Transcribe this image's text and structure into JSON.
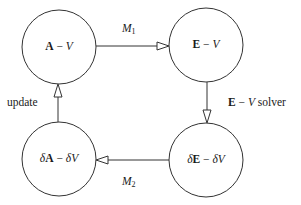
{
  "diagram": {
    "type": "flow-cycle",
    "nodes": [
      {
        "id": "av",
        "delta": "",
        "bold": "A",
        "sep": " − ",
        "deltaV": "",
        "ital": "V",
        "cx": 59,
        "cy": 47,
        "r": 37
      },
      {
        "id": "ev",
        "delta": "",
        "bold": "E",
        "sep": " − ",
        "deltaV": "",
        "ital": "V",
        "cx": 206,
        "cy": 45,
        "r": 37
      },
      {
        "id": "dedv",
        "delta": "δ",
        "bold": "E",
        "sep": " − ",
        "deltaV": "δ",
        "ital": "V",
        "cx": 206,
        "cy": 160,
        "r": 37
      },
      {
        "id": "dadv",
        "delta": "δ",
        "bold": "A",
        "sep": " − ",
        "deltaV": "δ",
        "ital": "V",
        "cx": 59,
        "cy": 159,
        "r": 37
      }
    ],
    "edges": [
      {
        "from": "av",
        "to": "ev",
        "label_script": "M",
        "label_sub": "1"
      },
      {
        "from": "ev",
        "to": "dedv",
        "label_bold": "E",
        "label_sep": " − ",
        "label_ital": "V",
        "label_rest": " solver"
      },
      {
        "from": "dedv",
        "to": "dadv",
        "label_script": "M",
        "label_sub": "2"
      },
      {
        "from": "dadv",
        "to": "av",
        "label_text": "update"
      }
    ],
    "colors": {
      "stroke": "#333333",
      "text": "#1a1a1a",
      "background": "#ffffff"
    }
  }
}
